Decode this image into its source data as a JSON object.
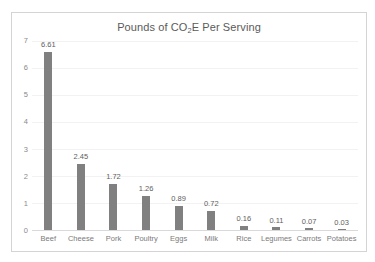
{
  "chart_data": {
    "type": "bar",
    "title": "Pounds of CO2E Per Serving",
    "title_prefix": "Pounds of CO",
    "title_sub": "2",
    "title_suffix": "E Per Serving",
    "xlabel": "",
    "ylabel": "",
    "ylim": [
      0,
      7
    ],
    "yticks": [
      "7",
      "6",
      "5",
      "4",
      "3",
      "2",
      "1",
      "0"
    ],
    "grid": true,
    "legend": "none",
    "bar_color": "#808080",
    "categories": [
      "Beef",
      "Cheese",
      "Pork",
      "Poultry",
      "Eggs",
      "Milk",
      "Rice",
      "Legumes",
      "Carrots",
      "Potatoes"
    ],
    "values": [
      6.61,
      2.45,
      1.72,
      1.26,
      0.89,
      0.72,
      0.16,
      0.11,
      0.07,
      0.03
    ],
    "value_labels": [
      "6.61",
      "2.45",
      "1.72",
      "1.26",
      "0.89",
      "0.72",
      "0.16",
      "0.11",
      "0.07",
      "0.03"
    ]
  }
}
